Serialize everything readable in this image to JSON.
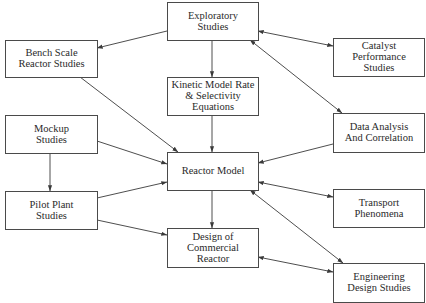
{
  "diagram": {
    "title": "",
    "colors": {
      "box_stroke": "#4a4a4a",
      "edge": "#3a3a3a",
      "text": "#2a2a2a",
      "background": "#ffffff"
    },
    "nodes": [
      {
        "id": "exploratory",
        "lines": [
          "Exploratory",
          "Studies"
        ],
        "x": 167,
        "y": 2,
        "w": 91,
        "h": 38
      },
      {
        "id": "bench",
        "lines": [
          "Bench Scale",
          "Reactor Studies"
        ],
        "x": 5,
        "y": 40,
        "w": 92,
        "h": 37
      },
      {
        "id": "catalyst",
        "lines": [
          "Catalyst",
          "Performance",
          "Studies"
        ],
        "x": 333,
        "y": 38,
        "w": 91,
        "h": 38
      },
      {
        "id": "kinetic",
        "lines": [
          "Kinetic Model Rate",
          "& Selectivity",
          "Equations"
        ],
        "x": 167,
        "y": 77,
        "w": 91,
        "h": 38
      },
      {
        "id": "mockup",
        "lines": [
          "Mockup",
          "Studies"
        ],
        "x": 5,
        "y": 115,
        "w": 92,
        "h": 38
      },
      {
        "id": "data_analysis",
        "lines": [
          "Data Analysis",
          "And Correlation"
        ],
        "x": 333,
        "y": 113,
        "w": 91,
        "h": 39
      },
      {
        "id": "reactor_model",
        "lines": [
          "Reactor Model"
        ],
        "x": 167,
        "y": 152,
        "w": 91,
        "h": 38
      },
      {
        "id": "pilot",
        "lines": [
          "Pilot Plant",
          "Studies"
        ],
        "x": 5,
        "y": 191,
        "w": 92,
        "h": 38
      },
      {
        "id": "transport",
        "lines": [
          "Transport",
          "Phenomena"
        ],
        "x": 333,
        "y": 189,
        "w": 91,
        "h": 38
      },
      {
        "id": "design",
        "lines": [
          "Design of",
          "Commercial",
          "Reactor"
        ],
        "x": 167,
        "y": 228,
        "w": 91,
        "h": 39
      },
      {
        "id": "engineering",
        "lines": [
          "Engineering",
          "Design Studies"
        ],
        "x": 333,
        "y": 263,
        "w": 91,
        "h": 39
      }
    ],
    "edges": [
      {
        "from": "exploratory",
        "to": "bench",
        "x1": 167,
        "y1": 31,
        "x2": 97,
        "y2": 48,
        "start_arrow": false,
        "end_arrow": true
      },
      {
        "from": "exploratory",
        "to": "catalyst",
        "x1": 258,
        "y1": 31,
        "x2": 333,
        "y2": 46,
        "start_arrow": true,
        "end_arrow": true
      },
      {
        "from": "exploratory",
        "to": "kinetic",
        "x1": 212,
        "y1": 40,
        "x2": 212,
        "y2": 77,
        "start_arrow": false,
        "end_arrow": true
      },
      {
        "from": "exploratory",
        "to": "data_analysis",
        "x1": 250,
        "y1": 40,
        "x2": 342,
        "y2": 113,
        "start_arrow": true,
        "end_arrow": true
      },
      {
        "from": "bench",
        "to": "reactor_model",
        "x1": 80,
        "y1": 77,
        "x2": 178,
        "y2": 152,
        "start_arrow": false,
        "end_arrow": true
      },
      {
        "from": "kinetic",
        "to": "reactor_model",
        "x1": 212,
        "y1": 115,
        "x2": 212,
        "y2": 152,
        "start_arrow": false,
        "end_arrow": true
      },
      {
        "from": "mockup",
        "to": "reactor_model",
        "x1": 97,
        "y1": 141,
        "x2": 167,
        "y2": 164,
        "start_arrow": false,
        "end_arrow": true
      },
      {
        "from": "mockup",
        "to": "pilot",
        "x1": 50,
        "y1": 153,
        "x2": 50,
        "y2": 191,
        "start_arrow": false,
        "end_arrow": true
      },
      {
        "from": "data_analysis",
        "to": "reactor_model",
        "x1": 333,
        "y1": 144,
        "x2": 258,
        "y2": 163,
        "start_arrow": false,
        "end_arrow": true
      },
      {
        "from": "pilot",
        "to": "reactor_model",
        "x1": 97,
        "y1": 198,
        "x2": 167,
        "y2": 182,
        "start_arrow": false,
        "end_arrow": true
      },
      {
        "from": "pilot",
        "to": "design",
        "x1": 97,
        "y1": 220,
        "x2": 167,
        "y2": 235,
        "start_arrow": false,
        "end_arrow": true
      },
      {
        "from": "reactor_model",
        "to": "transport",
        "x1": 258,
        "y1": 182,
        "x2": 333,
        "y2": 197,
        "start_arrow": true,
        "end_arrow": true
      },
      {
        "from": "reactor_model",
        "to": "design",
        "x1": 212,
        "y1": 190,
        "x2": 212,
        "y2": 228,
        "start_arrow": false,
        "end_arrow": true
      },
      {
        "from": "reactor_model",
        "to": "engineering",
        "x1": 250,
        "y1": 190,
        "x2": 343,
        "y2": 263,
        "start_arrow": true,
        "end_arrow": true
      },
      {
        "from": "design",
        "to": "engineering",
        "x1": 258,
        "y1": 257,
        "x2": 333,
        "y2": 272,
        "start_arrow": true,
        "end_arrow": true
      }
    ]
  }
}
